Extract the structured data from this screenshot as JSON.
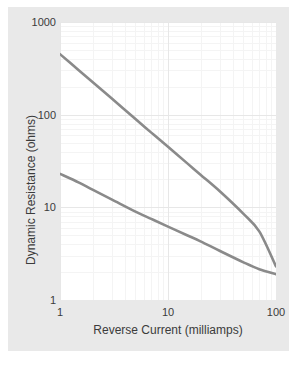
{
  "chart_data": {
    "type": "line",
    "title": "",
    "xlabel": "Reverse Current (milliamps)",
    "ylabel": "Dynamic Resistance (ohms)",
    "xscale": "log",
    "yscale": "log",
    "xlim": [
      1,
      100
    ],
    "ylim": [
      1,
      1000
    ],
    "xticks": [
      1,
      10,
      100
    ],
    "xtick_labels": [
      "1",
      "10",
      "100"
    ],
    "yticks": [
      1,
      10,
      100,
      1000
    ],
    "ytick_labels": [
      "1",
      "10",
      "100",
      "1000"
    ],
    "grid": true,
    "minor_grid": true,
    "legend": "none",
    "series": [
      {
        "name": "upper-curve",
        "color": "#8a8a8a",
        "x": [
          1,
          1.5,
          2,
          3,
          5,
          7,
          10,
          15,
          20,
          30,
          50,
          70,
          100
        ],
        "y": [
          450,
          300,
          225,
          150,
          90,
          64,
          45,
          30,
          22.5,
          15,
          8.5,
          5.5,
          2.3
        ]
      },
      {
        "name": "lower-curve",
        "color": "#8a8a8a",
        "x": [
          1,
          1.5,
          2,
          3,
          5,
          7,
          10,
          15,
          20,
          30,
          50,
          70,
          100
        ],
        "y": [
          23,
          18.5,
          15.5,
          12.2,
          9.0,
          7.5,
          6.2,
          5.0,
          4.3,
          3.4,
          2.55,
          2.15,
          1.9
        ]
      }
    ]
  },
  "figure": {
    "panel_color": "#e9e9e9",
    "plot_background": "#ffffff",
    "grid_color": "#ececec",
    "minor_grid_color": "#f4f4f4",
    "curve_color": "#8a8a8a",
    "text_color": "#3b3b3b"
  },
  "axes": {
    "x_title": "Reverse Current (milliamps)",
    "y_title": "Dynamic Resistance (ohms)",
    "x_tick_1": "1",
    "x_tick_2": "10",
    "x_tick_3": "100",
    "y_tick_1": "1",
    "y_tick_2": "10",
    "y_tick_3": "100",
    "y_tick_4": "1000"
  }
}
